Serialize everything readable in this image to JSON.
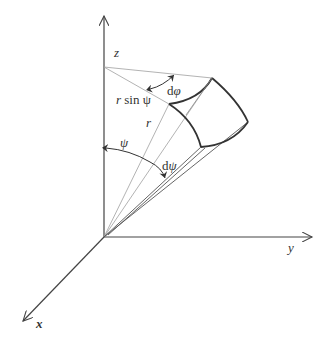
{
  "figure": {
    "axes": {
      "z": {
        "label": "z"
      },
      "y": {
        "label": "y"
      },
      "x": {
        "label": "x"
      }
    },
    "labels": {
      "r_sin_psi": "r sin ψ",
      "r_sin_psi_r": "r",
      "r_sin_psi_rest": " sin ψ",
      "r": "r",
      "psi": "ψ",
      "d_psi": "dψ",
      "d_psi_d": "d",
      "d_psi_sym": "ψ",
      "d_phi": "dφ",
      "d_phi_d": "d",
      "d_phi_sym": "φ"
    },
    "colors": {
      "axis": "#444444",
      "thin_line": "#9a9a9a",
      "element_edge": "#333333",
      "text": "#333333"
    }
  }
}
